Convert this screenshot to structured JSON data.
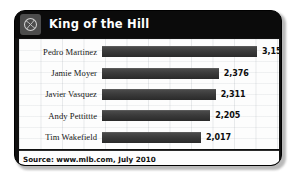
{
  "header": {
    "title": "King of the Hill",
    "logo_icon": "baseball-icon"
  },
  "footer": {
    "source": "Source: www.mlb.com, July 2010"
  },
  "colors": {
    "card_background": "#111111",
    "header_background": "#0b0b0b",
    "plate_background": "#fdfdfd",
    "bar_fill": "#3b3b3b",
    "title_text": "#ffffff",
    "label_text": "#161616"
  },
  "chart_data": {
    "type": "bar",
    "orientation": "horizontal",
    "title": "King of the Hill",
    "xlabel": "",
    "ylabel": "",
    "grid": true,
    "legend": "none",
    "xlim": [
      0,
      3600
    ],
    "categories": [
      "Pedro Martinez",
      "Jamie Moyer",
      "Javier Vasquez",
      "Andy Pettittte",
      "Tim Wakefield"
    ],
    "values": [
      3154,
      2376,
      2311,
      2205,
      2017
    ],
    "value_labels": [
      "3,154",
      "2,376",
      "2,311",
      "2,205",
      "2,017"
    ],
    "rows": [
      {
        "label": "Pedro Martinez",
        "value": 3154,
        "value_label": "3,154",
        "bar_pct": 87.6
      },
      {
        "label": "Jamie Moyer",
        "value": 2376,
        "value_label": "2,376",
        "bar_pct": 66.0
      },
      {
        "label": "Javier Vasquez",
        "value": 2311,
        "value_label": "2,311",
        "bar_pct": 64.2
      },
      {
        "label": "Andy Pettittte",
        "value": 2205,
        "value_label": "2,205",
        "bar_pct": 61.2
      },
      {
        "label": "Tim Wakefield",
        "value": 2017,
        "value_label": "2,017",
        "bar_pct": 56.0
      }
    ]
  }
}
